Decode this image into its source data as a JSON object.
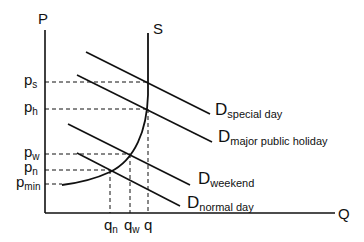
{
  "diagram": {
    "title": "",
    "axes": {
      "y_label": "P",
      "x_label": "Q"
    },
    "supply": {
      "label": "S"
    },
    "price_labels": [
      {
        "main": "p",
        "sub": "s"
      },
      {
        "main": "p",
        "sub": "h"
      },
      {
        "main": "p",
        "sub": "w"
      },
      {
        "main": "p",
        "sub": "n"
      },
      {
        "main": "p",
        "sub": "min"
      }
    ],
    "quantity_labels": [
      {
        "main": "q",
        "sub": "n"
      },
      {
        "main": "q",
        "sub": "w"
      },
      {
        "main": "q",
        "sub": ""
      }
    ],
    "demand_curves": [
      {
        "main": "D",
        "sub": "special day"
      },
      {
        "main": "D",
        "sub": "major public holiday"
      },
      {
        "main": "D",
        "sub": "weekend"
      },
      {
        "main": "D",
        "sub": "normal day"
      }
    ],
    "colors": {
      "line": "#111111",
      "background": "#ffffff"
    }
  }
}
